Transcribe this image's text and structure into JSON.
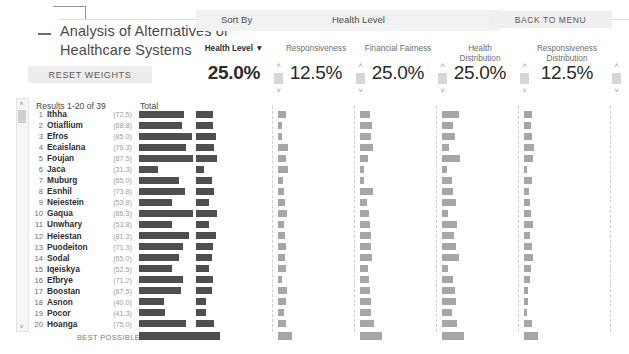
{
  "window": {
    "minimize_label": "—"
  },
  "header": {
    "title": "Analysis of Alternatives of Healthcare Systems",
    "reset_label": "RESET WEIGHTS",
    "back_label": "BACK TO MENU",
    "sort_label": "Sort By",
    "sort_value": "Health Level"
  },
  "criteria": [
    {
      "name": "Health Level ▼",
      "value": "25.0%",
      "active": true,
      "left": 196,
      "width": 76
    },
    {
      "name": "Responsiveness",
      "value": "12.5%",
      "active": false,
      "left": 278,
      "width": 76
    },
    {
      "name": "Financial Fairness",
      "value": "25.0%",
      "active": false,
      "left": 360,
      "width": 76
    },
    {
      "name": "Health\nDistribution",
      "value": "25.0%",
      "active": false,
      "left": 442,
      "width": 76
    },
    {
      "name": "Responsiveness\nDistribution",
      "value": "12.5%",
      "active": false,
      "left": 524,
      "width": 86
    }
  ],
  "criteria_names": [
    "Health Level ▼",
    "Responsiveness",
    "Financial Fairness",
    "Health Distribution",
    "Responsiveness Distribution"
  ],
  "list": {
    "results_label": "Results 1-20 of 39",
    "total_label": "Total",
    "best_possible_label": "BEST POSSIBLE",
    "scroll_up_icon": "˄",
    "scroll_down_icon": "˅"
  },
  "icons": {
    "spinner_up": "˄",
    "spinner_down": "˅",
    "sort-desc-icon": "▼"
  },
  "colors": {
    "total_bar": "#4f4f4f",
    "criterion_bar": "#a6a6a6",
    "button_bg": "#ededed",
    "sortbar_bg": "#f2f2f2",
    "text": "#3b3b3b"
  },
  "chart_data": {
    "type": "bar",
    "title": "Analysis of Alternatives of Healthcare Systems",
    "xlabel": "",
    "ylabel": "",
    "columns": [
      "Total",
      "Health Level",
      "Responsiveness",
      "Financial Fairness",
      "Health Distribution",
      "Responsiveness Distribution"
    ],
    "weights": [
      null,
      25.0,
      12.5,
      25.0,
      25.0,
      12.5
    ],
    "rows": [
      {
        "rank": "1",
        "name": "Ithha",
        "score": "(72.5)",
        "total": 72.5,
        "values": [
          72.5,
          60.0,
          45.0,
          75.0,
          55.0
        ]
      },
      {
        "rank": "2",
        "name": "Otiaflium",
        "score": "(68.8)",
        "total": 68.8,
        "values": [
          68.8,
          30.0,
          55.0,
          50.0,
          48.0
        ]
      },
      {
        "rank": "3",
        "name": "Efros",
        "score": "(85.0)",
        "total": 85.0,
        "values": [
          85.0,
          28.0,
          52.0,
          60.0,
          60.0
        ]
      },
      {
        "rank": "4",
        "name": "Ecaislana",
        "score": "(76.3)",
        "total": 76.3,
        "values": [
          76.3,
          72.0,
          60.0,
          30.0,
          70.0
        ]
      },
      {
        "rank": "5",
        "name": "Foujan",
        "score": "(87.5)",
        "total": 87.5,
        "values": [
          87.5,
          58.0,
          38.0,
          82.0,
          66.0
        ]
      },
      {
        "rank": "6",
        "name": "Jaca",
        "score": "(31.3)",
        "total": 31.3,
        "values": [
          31.3,
          70.0,
          20.0,
          22.0,
          20.0
        ]
      },
      {
        "rank": "7",
        "name": "Muburg",
        "score": "(65.0)",
        "total": 65.0,
        "values": [
          65.0,
          36.0,
          18.0,
          45.0,
          55.0
        ]
      },
      {
        "rank": "8",
        "name": "Esnhil",
        "score": "(73.8)",
        "total": 73.8,
        "values": [
          73.8,
          46.0,
          60.0,
          52.0,
          36.0
        ]
      },
      {
        "rank": "9",
        "name": "Neiestein",
        "score": "(53.8)",
        "total": 53.8,
        "values": [
          53.8,
          52.0,
          30.0,
          65.0,
          42.0
        ]
      },
      {
        "rank": "10",
        "name": "Gaqua",
        "score": "(86.3)",
        "total": 86.3,
        "values": [
          86.3,
          62.0,
          42.0,
          25.0,
          52.0
        ]
      },
      {
        "rank": "11",
        "name": "Unwhary",
        "score": "(53.8)",
        "total": 53.8,
        "values": [
          53.8,
          42.0,
          44.0,
          70.0,
          62.0
        ]
      },
      {
        "rank": "12",
        "name": "Heiestan",
        "score": "(81.3)",
        "total": 81.3,
        "values": [
          81.3,
          50.0,
          48.0,
          55.0,
          40.0
        ]
      },
      {
        "rank": "13",
        "name": "Puodeiton",
        "score": "(71.3)",
        "total": 71.3,
        "values": [
          71.3,
          56.0,
          50.0,
          64.0,
          58.0
        ]
      },
      {
        "rank": "14",
        "name": "Sodal",
        "score": "(65.0)",
        "total": 65.0,
        "values": [
          65.0,
          48.0,
          56.0,
          75.0,
          64.0
        ]
      },
      {
        "rank": "15",
        "name": "Iqeiskya",
        "score": "(52.5)",
        "total": 52.5,
        "values": [
          52.5,
          54.0,
          35.0,
          28.0,
          50.0
        ]
      },
      {
        "rank": "16",
        "name": "Efbrye",
        "score": "(71.2)",
        "total": 71.2,
        "values": [
          71.2,
          30.0,
          40.0,
          48.0,
          44.0
        ]
      },
      {
        "rank": "17",
        "name": "Boostan",
        "score": "(67.5)",
        "total": 67.5,
        "values": [
          67.5,
          64.0,
          46.0,
          58.0,
          30.0
        ]
      },
      {
        "rank": "18",
        "name": "Asnon",
        "score": "(40.0)",
        "total": 40.0,
        "values": [
          40.0,
          60.0,
          52.0,
          62.0,
          25.0
        ]
      },
      {
        "rank": "19",
        "name": "Pocor",
        "score": "(41.3)",
        "total": 41.3,
        "values": [
          41.3,
          40.0,
          48.0,
          46.0,
          22.0
        ]
      },
      {
        "rank": "20",
        "name": "Hoanga",
        "score": "(75.0)",
        "total": 75.0,
        "values": [
          75.0,
          58.0,
          62.0,
          68.0,
          54.0
        ]
      }
    ],
    "best_possible": {
      "total": 100,
      "values": [
        100,
        100,
        100,
        100,
        100
      ]
    }
  }
}
